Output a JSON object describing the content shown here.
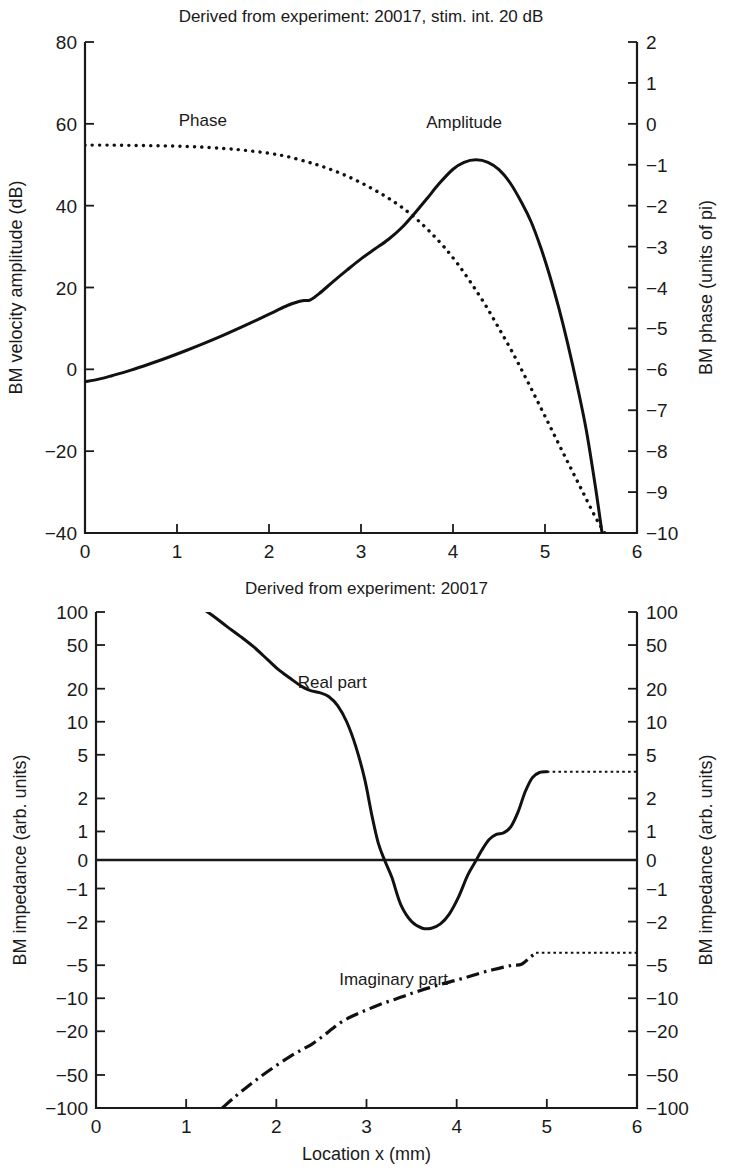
{
  "figure": {
    "background": "#ffffff",
    "ink": "#111111",
    "panels": [
      "top",
      "bottom"
    ]
  },
  "chart_data": [
    {
      "id": "bm-velocity-phase",
      "type": "line",
      "title": "Derived from experiment: 20017, stim. int. 20 dB",
      "xlabel": "Location x (mm)",
      "ylabel": "BM velocity amplitude (dB)",
      "ylabel_right": "BM phase (units of pi)",
      "xlim": [
        0,
        6
      ],
      "ylim": [
        -40,
        80
      ],
      "ylim_right": [
        -10,
        2
      ],
      "xticks": [
        0,
        1,
        2,
        3,
        4,
        5,
        6
      ],
      "xticklabels": [
        "0",
        "1",
        "2",
        "3",
        "4",
        "5",
        "6"
      ],
      "yticks": [
        -40,
        -20,
        0,
        20,
        40,
        60,
        80
      ],
      "yticklabels": [
        "-40",
        "-20",
        "0",
        "20",
        "40",
        "60",
        "80"
      ],
      "yticks_right": [
        -10,
        -9,
        -8,
        -7,
        -6,
        -5,
        -4,
        -3,
        -2,
        -1,
        0,
        1,
        2
      ],
      "yticklabels_right": [
        "-10",
        "-9",
        "-8",
        "-7",
        "-6",
        "-5",
        "-4",
        "-3",
        "-2",
        "-1",
        "0",
        "1",
        "2"
      ],
      "grid": false,
      "legend": "inline-annotations",
      "annotations": [
        {
          "text": "Phase",
          "x": 1.28,
          "y": 59.5
        },
        {
          "text": "Amplitude",
          "x": 4.12,
          "y": 59.0
        }
      ],
      "series": [
        {
          "name": "Amplitude",
          "style": "solid",
          "axis": "left",
          "units": "dB",
          "x": [
            0.0,
            0.15,
            0.3,
            0.5,
            0.7,
            0.9,
            1.1,
            1.3,
            1.5,
            1.7,
            1.9,
            2.05,
            2.2,
            2.3,
            2.38,
            2.45,
            2.55,
            2.7,
            2.85,
            3.0,
            3.15,
            3.3,
            3.45,
            3.6,
            3.72,
            3.85,
            4.0,
            4.12,
            4.25,
            4.38,
            4.5,
            4.62,
            4.75,
            4.85,
            4.95,
            5.05,
            5.15,
            5.25,
            5.35,
            5.45,
            5.55,
            5.62
          ],
          "y": [
            -3.0,
            -2.4,
            -1.5,
            -0.2,
            1.3,
            2.9,
            4.6,
            6.4,
            8.3,
            10.3,
            12.4,
            14.0,
            15.6,
            16.4,
            16.8,
            17.0,
            18.6,
            21.5,
            24.3,
            27.0,
            29.4,
            31.8,
            34.8,
            38.6,
            41.8,
            45.4,
            48.9,
            50.6,
            51.2,
            50.6,
            48.8,
            45.6,
            40.6,
            36.0,
            30.0,
            23.0,
            15.0,
            6.0,
            -4.0,
            -15.0,
            -29.0,
            -40.0
          ]
        },
        {
          "name": "Phase",
          "style": "dotted",
          "axis": "right",
          "units": "pi",
          "x": [
            0.0,
            0.3,
            0.6,
            0.9,
            1.2,
            1.5,
            1.75,
            2.0,
            2.2,
            2.4,
            2.55,
            2.7,
            2.85,
            3.0,
            3.15,
            3.3,
            3.45,
            3.6,
            3.75,
            3.9,
            4.05,
            4.2,
            4.35,
            4.5,
            4.65,
            4.8,
            4.95,
            5.1,
            5.25,
            5.4,
            5.55,
            5.65
          ],
          "y": [
            -0.52,
            -0.52,
            -0.53,
            -0.54,
            -0.56,
            -0.6,
            -0.65,
            -0.72,
            -0.8,
            -0.92,
            -1.02,
            -1.14,
            -1.28,
            -1.44,
            -1.62,
            -1.82,
            -2.05,
            -2.32,
            -2.64,
            -3.0,
            -3.42,
            -3.9,
            -4.42,
            -5.0,
            -5.6,
            -6.25,
            -6.92,
            -7.6,
            -8.28,
            -8.95,
            -9.62,
            -10.0
          ]
        }
      ]
    },
    {
      "id": "bm-impedance",
      "type": "line",
      "title": "Derived from experiment: 20017",
      "xlabel": "Location x (mm)",
      "ylabel": "BM impedance (arb. units)",
      "ylabel_right": "BM impedance (arb. units)",
      "xlim": [
        0,
        6
      ],
      "yscale": "symlog",
      "ylim": [
        -100,
        100
      ],
      "xticks": [
        0,
        1,
        2,
        3,
        4,
        5,
        6
      ],
      "xticklabels": [
        "0",
        "1",
        "2",
        "3",
        "4",
        "5",
        "6"
      ],
      "yticks": [
        100,
        50,
        20,
        10,
        5,
        2,
        1,
        0,
        -1,
        -2,
        -5,
        -10,
        -20,
        -50,
        -100
      ],
      "yticklabels": [
        "100",
        "50",
        "20",
        "10",
        "5",
        "2",
        "1",
        "0",
        "-1",
        "-2",
        "-5",
        "-10",
        "-20",
        "-50",
        "-100"
      ],
      "grid": false,
      "zero_line": true,
      "legend": "inline-annotations",
      "annotations": [
        {
          "text": "Real part",
          "x": 2.62,
          "y_px": 688
        },
        {
          "text": "Imaginary part",
          "x": 3.3,
          "y_px": 985
        }
      ],
      "series": [
        {
          "name": "Real part",
          "style": "solid",
          "x": [
            1.15,
            1.3,
            1.45,
            1.6,
            1.75,
            1.9,
            2.02,
            2.15,
            2.28,
            2.38,
            2.48,
            2.58,
            2.68,
            2.78,
            2.88,
            2.98,
            3.06,
            3.13,
            3.2,
            3.28,
            3.38,
            3.5,
            3.62,
            3.72,
            3.82,
            3.92,
            4.02,
            4.12,
            4.2,
            4.28,
            4.36,
            4.44,
            4.52,
            4.6,
            4.68,
            4.76,
            4.84,
            4.92,
            5.0
          ],
          "y": [
            112.0,
            92.0,
            74.0,
            60.0,
            48.0,
            37.0,
            30.0,
            25.0,
            21.0,
            19.2,
            18.4,
            17.0,
            14.0,
            10.0,
            6.0,
            3.0,
            1.4,
            0.6,
            0.0,
            -0.6,
            -1.4,
            -2.0,
            -2.3,
            -2.3,
            -2.1,
            -1.7,
            -1.2,
            -0.55,
            -0.1,
            0.35,
            0.72,
            0.9,
            0.95,
            1.1,
            1.5,
            2.3,
            3.1,
            3.45,
            3.5
          ]
        },
        {
          "name": "Real part (extrapolated)",
          "style": "fine-dotted",
          "x": [
            5.0,
            5.4,
            5.8,
            6.0
          ],
          "y": [
            3.5,
            3.5,
            3.5,
            3.5
          ]
        },
        {
          "name": "Imaginary part",
          "style": "dashdot",
          "x": [
            1.4,
            1.55,
            1.7,
            1.85,
            2.0,
            2.15,
            2.28,
            2.4,
            2.52,
            2.62,
            2.72,
            2.84,
            2.96,
            3.08,
            3.2,
            3.32,
            3.44,
            3.56,
            3.7,
            3.84,
            3.98,
            4.12,
            4.26,
            4.4,
            4.52,
            4.62,
            4.72,
            4.82,
            4.88
          ],
          "y": [
            -100.0,
            -78.0,
            -62.0,
            -50.0,
            -41.0,
            -34.0,
            -29.5,
            -26.0,
            -22.0,
            -19.0,
            -16.5,
            -14.6,
            -13.2,
            -12.0,
            -11.0,
            -10.2,
            -9.4,
            -8.7,
            -8.0,
            -7.4,
            -6.9,
            -6.4,
            -5.9,
            -5.5,
            -5.2,
            -5.0,
            -4.9,
            -4.2,
            -3.85
          ]
        },
        {
          "name": "Imaginary part (extrapolated)",
          "style": "fine-dotted",
          "x": [
            4.88,
            5.3,
            5.7,
            6.0
          ],
          "y": [
            -3.85,
            -3.85,
            -3.85,
            -3.85
          ]
        }
      ]
    }
  ]
}
